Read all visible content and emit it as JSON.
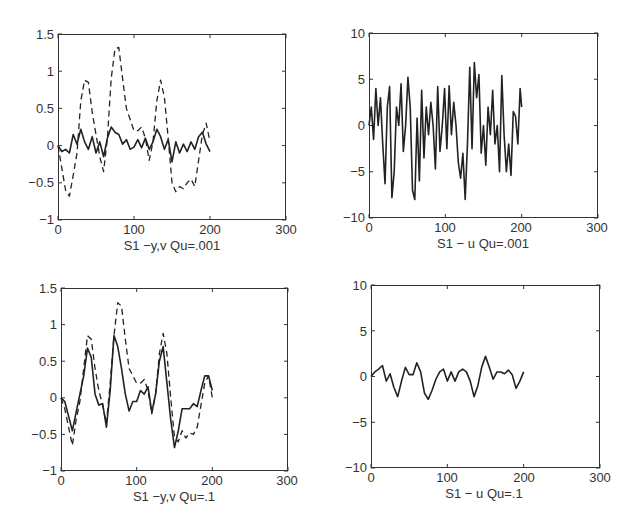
{
  "chart_data": [
    {
      "id": "top-left",
      "type": "line",
      "title": "",
      "xlabel": "S1 −y,v Qu=.001",
      "ylabel": "",
      "xlim": [
        0,
        300
      ],
      "ylim": [
        -1,
        1.5
      ],
      "xticks": [
        "0",
        "100",
        "200",
        "300"
      ],
      "yticks": [
        "1.5",
        "1",
        "0.5",
        "0",
        "−0.5",
        "−1"
      ],
      "grid": false,
      "legend": null,
      "x": [
        0,
        5,
        10,
        15,
        20,
        25,
        30,
        35,
        40,
        45,
        50,
        55,
        60,
        65,
        70,
        75,
        80,
        85,
        90,
        95,
        100,
        105,
        110,
        115,
        120,
        125,
        130,
        135,
        140,
        145,
        150,
        155,
        160,
        165,
        170,
        175,
        180,
        185,
        190,
        195,
        200
      ],
      "series": [
        {
          "name": "y",
          "style": "solid",
          "values": [
            0,
            -0.08,
            -0.05,
            -0.1,
            0.15,
            0.02,
            0.22,
            0.05,
            -0.05,
            0.12,
            -0.1,
            0.05,
            -0.15,
            0.1,
            0.25,
            0.18,
            0.15,
            0.02,
            0.08,
            -0.05,
            -0.02,
            0.08,
            -0.03,
            0.1,
            -0.05,
            0.05,
            0.22,
            0.12,
            -0.05,
            0.08,
            -0.22,
            0.05,
            -0.1,
            0.02,
            -0.08,
            0.05,
            -0.05,
            0.12,
            0.18,
            0.02,
            -0.08
          ]
        },
        {
          "name": "v",
          "style": "dashed",
          "values": [
            0,
            -0.3,
            -0.6,
            -0.68,
            -0.4,
            -0.1,
            0.6,
            0.88,
            0.85,
            0.45,
            0.15,
            -0.15,
            -0.35,
            0.1,
            0.9,
            1.3,
            1.32,
            0.9,
            0.5,
            0.35,
            0.2,
            0.2,
            0.25,
            0.1,
            -0.2,
            0.05,
            0.6,
            0.88,
            0.65,
            0.1,
            -0.5,
            -0.62,
            -0.55,
            -0.58,
            -0.5,
            -0.45,
            -0.55,
            -0.2,
            0.15,
            0.3,
            0.05
          ]
        }
      ]
    },
    {
      "id": "top-right",
      "type": "line",
      "title": "",
      "xlabel": "S1 − u  Qu=.001",
      "ylabel": "",
      "xlim": [
        0,
        300
      ],
      "ylim": [
        -10,
        10
      ],
      "xticks": [
        "0",
        "100",
        "200",
        "300"
      ],
      "yticks": [
        "10",
        "5",
        "0",
        "−5",
        "−10"
      ],
      "grid": false,
      "legend": null,
      "x": [
        0,
        3,
        6,
        9,
        12,
        15,
        18,
        21,
        24,
        27,
        30,
        33,
        36,
        39,
        42,
        45,
        48,
        51,
        54,
        57,
        60,
        63,
        66,
        69,
        72,
        75,
        78,
        81,
        84,
        87,
        90,
        93,
        96,
        99,
        102,
        105,
        108,
        111,
        114,
        117,
        120,
        123,
        126,
        129,
        132,
        135,
        138,
        141,
        144,
        147,
        150,
        153,
        156,
        159,
        162,
        165,
        168,
        171,
        174,
        177,
        180,
        183,
        186,
        189,
        192,
        195,
        198,
        200
      ],
      "series": [
        {
          "name": "u",
          "style": "solid",
          "values": [
            0,
            2,
            -1.5,
            4,
            0,
            3,
            -2,
            -6.3,
            2,
            4.2,
            -7.8,
            -5,
            2,
            0,
            4.5,
            -2.8,
            0,
            5.2,
            2,
            -7,
            -8,
            0.8,
            -6,
            3.8,
            -3.5,
            2,
            -1,
            2.5,
            0,
            -4.7,
            4.2,
            -2.8,
            0,
            4,
            -2.5,
            4.3,
            -1,
            2.5,
            0,
            -4,
            -5.7,
            -3,
            -8,
            -2,
            6.3,
            -2.5,
            6.8,
            3,
            5.5,
            -3,
            0,
            -4.3,
            2,
            -1,
            3.8,
            -2,
            0,
            -5,
            5.4,
            -1,
            -5,
            -2,
            -5.4,
            1.5,
            1,
            -2,
            4,
            2
          ]
        }
      ]
    },
    {
      "id": "bottom-left",
      "type": "line",
      "title": "",
      "xlabel": "S1 −y,v Qu=.1",
      "ylabel": "",
      "xlim": [
        0,
        300
      ],
      "ylim": [
        -1,
        1.5
      ],
      "xticks": [
        "0",
        "100",
        "200",
        "300"
      ],
      "yticks": [
        "1.5",
        "1",
        "0.5",
        "0",
        "−0.5",
        "−1"
      ],
      "grid": false,
      "legend": null,
      "x": [
        0,
        5,
        10,
        15,
        20,
        25,
        30,
        35,
        40,
        45,
        50,
        55,
        60,
        65,
        70,
        75,
        80,
        85,
        90,
        95,
        100,
        105,
        110,
        115,
        120,
        125,
        130,
        135,
        140,
        145,
        150,
        155,
        160,
        165,
        170,
        175,
        180,
        185,
        190,
        195,
        200
      ],
      "series": [
        {
          "name": "y",
          "style": "solid",
          "values": [
            0,
            -0.05,
            -0.25,
            -0.45,
            -0.2,
            0.05,
            0.3,
            0.68,
            0.55,
            0.05,
            -0.1,
            -0.08,
            -0.4,
            0.1,
            0.85,
            0.7,
            0.4,
            0.05,
            -0.18,
            -0.05,
            -0.05,
            0.1,
            0.05,
            0.15,
            -0.2,
            0.05,
            0.5,
            0.7,
            0.2,
            -0.3,
            -0.68,
            -0.45,
            -0.15,
            -0.15,
            -0.15,
            -0.08,
            -0.12,
            0.1,
            0.3,
            0.3,
            0.1
          ]
        },
        {
          "name": "v",
          "style": "dashed",
          "values": [
            0,
            -0.15,
            -0.4,
            -0.65,
            -0.3,
            -0.05,
            0.4,
            0.85,
            0.8,
            0.4,
            0.1,
            -0.1,
            -0.35,
            0.2,
            0.85,
            1.3,
            1.25,
            0.8,
            0.4,
            0.3,
            0.2,
            0.2,
            0.25,
            0.1,
            -0.22,
            0.05,
            0.6,
            0.88,
            0.6,
            0.0,
            -0.55,
            -0.6,
            -0.45,
            -0.55,
            -0.48,
            -0.5,
            -0.4,
            -0.1,
            0.2,
            0.3,
            0.0
          ]
        }
      ]
    },
    {
      "id": "bottom-right",
      "type": "line",
      "title": "",
      "xlabel": "S1 − u  Qu=.1",
      "ylabel": "",
      "xlim": [
        0,
        300
      ],
      "ylim": [
        -10,
        10
      ],
      "xticks": [
        "0",
        "100",
        "200",
        "300"
      ],
      "yticks": [
        "10",
        "5",
        "0",
        "−5",
        "−10"
      ],
      "grid": false,
      "legend": null,
      "x": [
        0,
        5,
        10,
        15,
        20,
        25,
        30,
        35,
        40,
        45,
        50,
        55,
        60,
        65,
        70,
        75,
        80,
        85,
        90,
        95,
        100,
        105,
        110,
        115,
        120,
        125,
        130,
        135,
        140,
        145,
        150,
        155,
        160,
        165,
        170,
        175,
        180,
        185,
        190,
        195,
        200
      ],
      "series": [
        {
          "name": "u",
          "style": "solid",
          "values": [
            0,
            0.5,
            0.8,
            1.2,
            -0.5,
            0.3,
            -1.2,
            -2.2,
            -0.5,
            1,
            0.2,
            0.2,
            1.5,
            0.5,
            -1.8,
            -2.5,
            -1.5,
            -0.3,
            0.5,
            0.8,
            -0.5,
            0.5,
            -0.5,
            0.5,
            0.8,
            0.5,
            -0.5,
            -2.2,
            -1,
            1,
            2.2,
            1,
            -0.3,
            0.5,
            0.5,
            0.3,
            0.7,
            0.2,
            -1.3,
            -0.5,
            0.5
          ]
        }
      ]
    }
  ]
}
